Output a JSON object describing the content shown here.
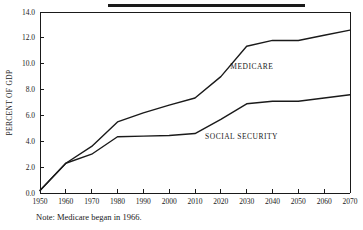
{
  "figure": {
    "note": "Note: Medicare began in 1966.",
    "title_rule_color": "#1a1a1a"
  },
  "chart_data": {
    "type": "line",
    "title": "",
    "subtitle": "",
    "xlabel": "",
    "ylabel": "PERCENT OF GDP",
    "xlim": [
      1950,
      2070
    ],
    "ylim": [
      0.0,
      14.0
    ],
    "grid": false,
    "legend_position": "inline-annotation",
    "x_ticks": [
      1950,
      1960,
      1970,
      1980,
      1990,
      2000,
      2010,
      2020,
      2030,
      2040,
      2050,
      2060,
      2070
    ],
    "x_tick_labels": [
      "1950",
      "1960",
      "1970",
      "1980",
      "1990",
      "2000",
      "2010",
      "2020",
      "2030",
      "2040",
      "2050",
      "2060",
      "2070"
    ],
    "y_ticks": [
      0.0,
      2.0,
      4.0,
      6.0,
      8.0,
      10.0,
      12.0,
      14.0
    ],
    "y_tick_labels": [
      "0.0",
      "2.0",
      "4.0",
      "6.0",
      "8.0",
      "10.0",
      "12.0",
      "14.0"
    ],
    "x": [
      1950,
      1960,
      1970,
      1980,
      1990,
      2000,
      2010,
      2020,
      2030,
      2040,
      2050,
      2060,
      2070
    ],
    "series": [
      {
        "name": "MEDICARE",
        "label_x": 2032,
        "label_y": 9.6,
        "values": [
          0.2,
          2.3,
          3.6,
          5.5,
          6.2,
          6.8,
          7.35,
          9.0,
          11.35,
          11.8,
          11.8,
          12.2,
          12.6
        ]
      },
      {
        "name": "SOCIAL SECURITY",
        "label_x": 2028,
        "label_y": 4.2,
        "values": [
          0.2,
          2.3,
          3.0,
          4.35,
          4.4,
          4.45,
          4.6,
          5.7,
          6.9,
          7.1,
          7.1,
          7.35,
          7.6
        ]
      }
    ],
    "annotations": [
      {
        "text": "MEDICARE"
      },
      {
        "text": "SOCIAL SECURITY"
      }
    ]
  }
}
